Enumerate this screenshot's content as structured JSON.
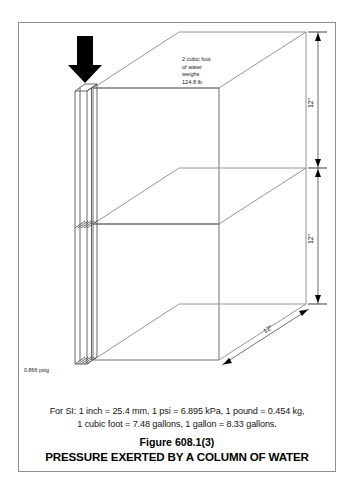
{
  "figure": {
    "number": "Figure 608.1(3)",
    "title": "PRESSURE EXERTED BY A COLUMN OF WATER",
    "si_note_line_1": "For SI:  1 inch = 25.4 mm, 1 psi = 6.895 kPa, 1 pound = 0.454 kg,",
    "si_note_line_2": "1 cubic foot = 7.48 gallons, 1 gallon = 8.33 gallons."
  },
  "diagram": {
    "water_note": {
      "line_1": "2 cubic foot",
      "line_2": "of water",
      "line_3": "weighs",
      "line_4": "124.8 lb"
    },
    "pressure_label": "0.866 psig",
    "dimension_upper": "12\"",
    "dimension_lower": "12\"",
    "dimension_depth": "12\"",
    "force_arrow": "down-arrow"
  },
  "colors": {
    "frame_border": "#8e8e8e",
    "cube_edge": "#8a8a8a",
    "arrow_fill": "#000000",
    "text": "#1a1a1a",
    "background": "#ffffff"
  }
}
